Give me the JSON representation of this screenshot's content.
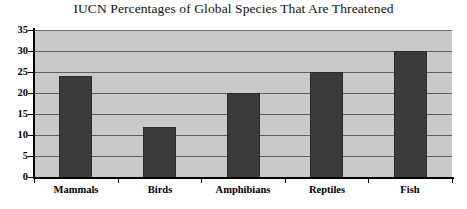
{
  "chart_data": {
    "type": "bar",
    "title": "IUCN Percentages of Global Species That Are Threatened",
    "xlabel": "",
    "ylabel": "",
    "categories": [
      "Mammals",
      "Birds",
      "Amphibians",
      "Reptiles",
      "Fish"
    ],
    "values": [
      24,
      12,
      20,
      25,
      30
    ],
    "ylim": [
      0,
      35
    ],
    "ytick_labels": [
      "35",
      "30",
      "25",
      "20",
      "15",
      "10",
      "5",
      "0"
    ],
    "ytick_values": [
      35,
      30,
      25,
      20,
      15,
      10,
      5,
      0
    ],
    "ytick_step": 5,
    "grid": true,
    "legend": false,
    "colors": {
      "bar_fill": "#3b3b3b",
      "plot_background": "#c9c9c9",
      "gridline": "#5f5f5f",
      "axis": "#000000",
      "text": "#000000",
      "figure_background": "#ffffff"
    }
  }
}
